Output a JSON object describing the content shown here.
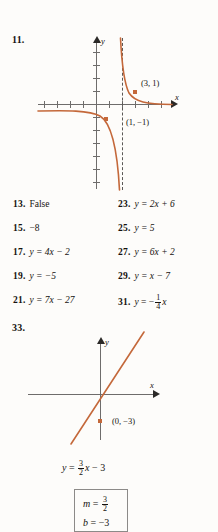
{
  "page": {
    "background_color": "#fdfcfa",
    "curve_color": "#c4683a",
    "axis_color": "#6e6c6b"
  },
  "exercise_11": {
    "number": "11.",
    "y_axis_label": "y",
    "x_axis_label": "x",
    "point_labels": [
      "(3, 1)",
      "(1, −1)"
    ],
    "points": [
      {
        "label": "(3, 1)",
        "x": 3,
        "y": 1
      },
      {
        "label": "(1, −1)",
        "x": 1,
        "y": -1
      }
    ],
    "asymptote": "x = 2",
    "description": "rational function graph with vertical asymptote"
  },
  "answers": [
    {
      "number": "13.",
      "text": "False",
      "italic": false
    },
    {
      "number": "23.",
      "lhs": "y",
      "op": "=",
      "rhs": "2x + 6",
      "italic": true
    },
    {
      "number": "15.",
      "text": "−8",
      "italic": false
    },
    {
      "number": "25.",
      "lhs": "y",
      "op": "=",
      "rhs": "5",
      "italic": true
    },
    {
      "number": "17.",
      "lhs": "y",
      "op": "=",
      "rhs": "4x − 2",
      "italic": true
    },
    {
      "number": "27.",
      "lhs": "y",
      "op": "=",
      "rhs": "6x + 2",
      "italic": true
    },
    {
      "number": "19.",
      "lhs": "y",
      "op": "=",
      "rhs": "−5",
      "italic": true
    },
    {
      "number": "29.",
      "lhs": "y",
      "op": "=",
      "rhs": "x − 7",
      "italic": true
    },
    {
      "number": "21.",
      "lhs": "y",
      "op": "=",
      "rhs": "7x − 27",
      "italic": true
    },
    {
      "number": "31.",
      "lhs": "y",
      "op": "=",
      "rhs": "fraction",
      "italic": true
    }
  ],
  "answer_rows": [
    {
      "left": {
        "number": "13.",
        "body": "False",
        "style": "plain"
      },
      "right": {
        "number": "23.",
        "body": "y = 2x + 6",
        "style": "eq"
      }
    },
    {
      "left": {
        "number": "15.",
        "body": "−8",
        "style": "plain"
      },
      "right": {
        "number": "25.",
        "body": "y = 5",
        "style": "eq"
      }
    },
    {
      "left": {
        "number": "17.",
        "body": "y = 4x − 2",
        "style": "eq"
      },
      "right": {
        "number": "27.",
        "body": "y = 6x + 2",
        "style": "eq"
      }
    },
    {
      "left": {
        "number": "19.",
        "body": "y = −5",
        "style": "eq"
      },
      "right": {
        "number": "29.",
        "body": "y = x − 7",
        "style": "eq"
      }
    },
    {
      "left": {
        "number": "21.",
        "body": "y = 7x − 27",
        "style": "eq"
      },
      "right": {
        "number": "31.",
        "body": "y = −(1/4)x",
        "style": "frac"
      }
    }
  ],
  "answer_31": {
    "number": "31.",
    "lhs": "y",
    "equals": "=",
    "sign": "−",
    "numerator": "1",
    "denominator": "4",
    "variable": "x"
  },
  "exercise_33": {
    "number": "33.",
    "y_axis_label": "y",
    "x_axis_label": "x",
    "point_label": "(0, −3)",
    "equation": {
      "lhs": "y",
      "equals": "=",
      "numerator": "3",
      "denominator": "2",
      "variable": "x",
      "constant": "− 3",
      "full": "y = (3/2)x − 3"
    },
    "boxed_answer": {
      "slope_symbol": "m",
      "slope_equals": "=",
      "slope_numerator": "3",
      "slope_denominator": "2",
      "intercept_symbol": "b",
      "intercept_equals": "=",
      "intercept_value": "−3"
    }
  }
}
